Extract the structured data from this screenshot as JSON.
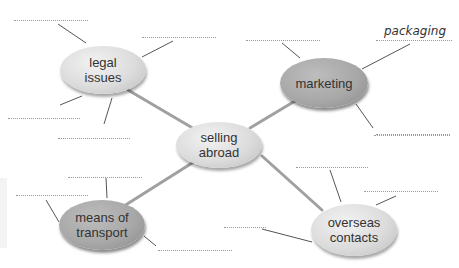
{
  "diagram": {
    "center": {
      "line1": "selling",
      "line2": "abroad"
    },
    "nodes": [
      {
        "id": "legal-issues",
        "line1": "legal",
        "line2": "issues",
        "style": "light"
      },
      {
        "id": "marketing",
        "line1": "marketing",
        "line2": "",
        "style": "dark"
      },
      {
        "id": "means-of-transport",
        "line1": "means of",
        "line2": "transport",
        "style": "dark"
      },
      {
        "id": "overseas-contacts",
        "line1": "overseas",
        "line2": "contacts",
        "style": "light"
      }
    ],
    "filled_answers": [
      {
        "node": "marketing",
        "text": "packaging"
      }
    ],
    "blank_count": 14
  },
  "colors": {
    "light_node": "#dcdcdc",
    "dark_node": "#a8a8a8",
    "connector": "#9e9e9e",
    "text": "#333333"
  }
}
